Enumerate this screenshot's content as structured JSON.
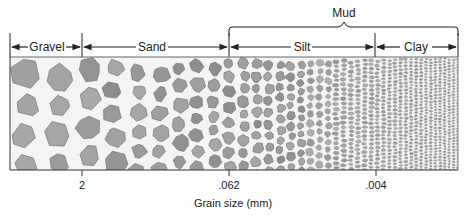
{
  "diagram": {
    "group_label": "Mud",
    "group_spans": [
      "Silt",
      "Clay"
    ],
    "classes": [
      {
        "name": "Gravel",
        "x0": 10,
        "x1": 82
      },
      {
        "name": "Sand",
        "x0": 82,
        "x1": 229
      },
      {
        "name": "Silt",
        "x0": 229,
        "x1": 375
      },
      {
        "name": "Clay",
        "x0": 375,
        "x1": 458
      }
    ],
    "boundaries": [
      {
        "value": "2",
        "x": 82
      },
      {
        "value": ".062",
        "x": 229
      },
      {
        "value": ".004",
        "x": 376
      }
    ],
    "axis_label": "Grain size (mm)",
    "colors": {
      "grain_fill": "#9a9a9a",
      "grain_edge": "#7d7d7d",
      "line": "#222222",
      "box_border": "#555555"
    }
  }
}
